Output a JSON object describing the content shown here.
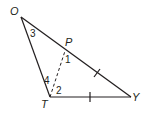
{
  "diagram": {
    "type": "triangle",
    "vertices": {
      "O": {
        "label": "O",
        "x": 21,
        "y": 17
      },
      "T": {
        "label": "T",
        "x": 50,
        "y": 97
      },
      "Y": {
        "label": "Y",
        "x": 131,
        "y": 97
      },
      "P": {
        "label": "P",
        "x": 65,
        "y": 51
      }
    },
    "segments": [
      {
        "from": "O",
        "to": "T",
        "style": "solid"
      },
      {
        "from": "T",
        "to": "Y",
        "style": "solid",
        "tick_marks": 1
      },
      {
        "from": "O",
        "to": "Y",
        "style": "solid"
      },
      {
        "from": "P",
        "to": "Y",
        "style": "solid",
        "tick_marks": 1
      },
      {
        "from": "T",
        "to": "P",
        "style": "dashed"
      }
    ],
    "angle_labels": {
      "a1": "1",
      "a2": "2",
      "a3": "3",
      "a4": "4"
    },
    "colors": {
      "stroke": "#231f20",
      "background": "#ffffff"
    }
  }
}
